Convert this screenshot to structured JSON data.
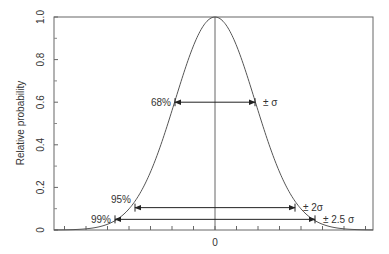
{
  "chart_data": {
    "type": "line",
    "title": "",
    "xlabel": "",
    "ylabel": "Relative probability",
    "ylim": [
      0,
      1.0
    ],
    "yticks": [
      "0",
      "0.2",
      "0.4",
      "0.6",
      "0.8",
      "1.0"
    ],
    "xticks": [
      "0"
    ],
    "grid": false,
    "legend": null,
    "series": [
      {
        "name": "Normal distribution (Gaussian)",
        "x_sigma": [
          -4,
          -3,
          -2.5,
          -2,
          -1.5,
          -1,
          -0.5,
          0,
          0.5,
          1,
          1.5,
          2,
          2.5,
          3,
          4
        ],
        "y": [
          0.0003,
          0.011,
          0.044,
          0.135,
          0.325,
          0.607,
          0.882,
          1.0,
          0.882,
          0.607,
          0.325,
          0.135,
          0.044,
          0.011,
          0.0003
        ]
      }
    ],
    "annotations": [
      {
        "left_label": "68%",
        "right_label": "± σ",
        "range_sigma": [
          -1,
          1
        ],
        "y": 0.6
      },
      {
        "left_label": "95%",
        "right_label": "± 2σ",
        "range_sigma": [
          -2,
          2
        ],
        "y": 0.105
      },
      {
        "left_label": "99%",
        "right_label": "± 2.5 σ",
        "range_sigma": [
          -2.5,
          2.5
        ],
        "y": 0.05
      }
    ]
  },
  "colors": {
    "line": "#555555",
    "text": "#333333",
    "background": "#ffffff"
  }
}
